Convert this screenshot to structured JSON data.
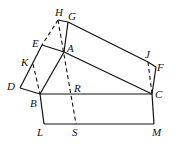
{
  "diagram": {
    "type": "geometry",
    "labels": {
      "H": "H",
      "G": "G",
      "E": "E",
      "A": "A",
      "K": "K",
      "D": "D",
      "B": "B",
      "R": "R",
      "C": "C",
      "J": "J",
      "F": "F",
      "L": "L",
      "S": "S",
      "M": "M"
    },
    "points": {
      "H": [
        58,
        20
      ],
      "G": [
        68,
        22
      ],
      "E": [
        42,
        45
      ],
      "A": [
        64,
        52
      ],
      "K": [
        33,
        64
      ],
      "D": [
        20,
        88
      ],
      "B": [
        40,
        94
      ],
      "R": [
        71,
        94
      ],
      "C": [
        152,
        94
      ],
      "J": [
        148,
        62
      ],
      "F": [
        156,
        67
      ],
      "L": [
        44,
        124
      ],
      "S": [
        76,
        124
      ],
      "M": [
        154,
        124
      ]
    },
    "solid_segments": [
      [
        "H",
        "G"
      ],
      [
        "G",
        "J"
      ],
      [
        "J",
        "F"
      ],
      [
        "F",
        "C"
      ],
      [
        "G",
        "A"
      ],
      [
        "A",
        "B"
      ],
      [
        "E",
        "A"
      ],
      [
        "A",
        "C"
      ],
      [
        "E",
        "D"
      ],
      [
        "D",
        "B"
      ],
      [
        "B",
        "C"
      ],
      [
        "B",
        "L"
      ],
      [
        "L",
        "M"
      ],
      [
        "M",
        "C"
      ]
    ],
    "dashed_segments": [
      [
        "H",
        "E"
      ],
      [
        "H",
        "S"
      ],
      [
        "K",
        "B"
      ],
      [
        "J",
        "C"
      ]
    ],
    "line_color": "#111111"
  }
}
